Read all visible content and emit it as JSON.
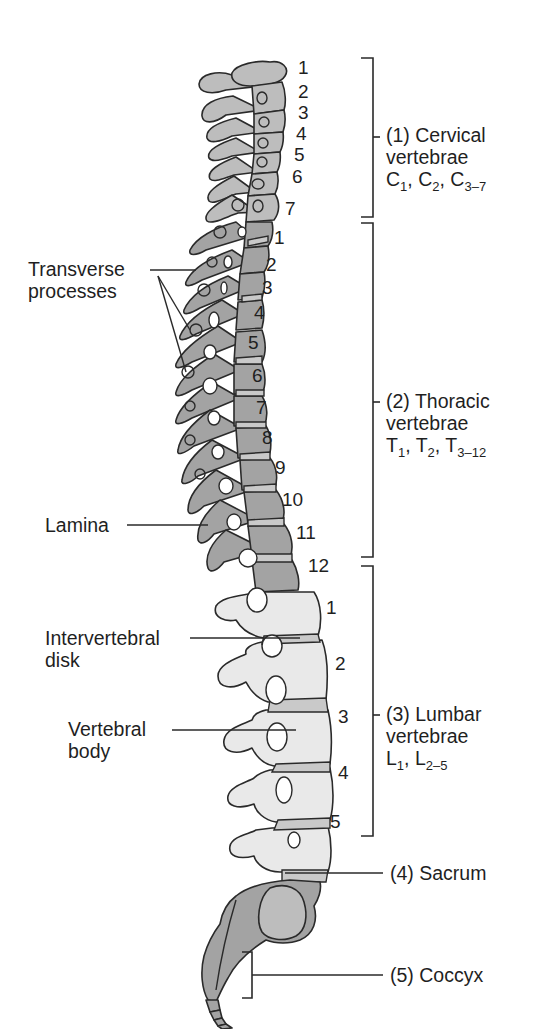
{
  "diagram": {
    "colors": {
      "bone_dark": "#a0a0a0",
      "bone_light": "#e8e8e8",
      "outline": "#2a2a2a",
      "disk": "#c8c8c8",
      "background": "#ffffff"
    },
    "regions": [
      {
        "id": "cervical",
        "index": "(1)",
        "name": "Cervical",
        "line2": "vertebrae",
        "formula": {
          "letter": "C",
          "parts": [
            "1",
            "2",
            "3–7"
          ]
        }
      },
      {
        "id": "thoracic",
        "index": "(2)",
        "name": "Thoracic",
        "line2": "vertebrae",
        "formula": {
          "letter": "T",
          "parts": [
            "1",
            "2",
            "3–12"
          ]
        }
      },
      {
        "id": "lumbar",
        "index": "(3)",
        "name": "Lumbar",
        "line2": "vertebrae",
        "formula": {
          "letter": "L",
          "parts": [
            "1",
            "2–5"
          ]
        }
      },
      {
        "id": "sacrum",
        "index": "(4)",
        "name": "Sacrum"
      },
      {
        "id": "coccyx",
        "index": "(5)",
        "name": "Coccyx"
      }
    ],
    "vertebra_numbers": {
      "cervical": [
        "1",
        "2",
        "3",
        "4",
        "5",
        "6",
        "7"
      ],
      "thoracic": [
        "1",
        "2",
        "3",
        "4",
        "5",
        "6",
        "7",
        "8",
        "9",
        "10",
        "11",
        "12"
      ],
      "lumbar": [
        "1",
        "2",
        "3",
        "4",
        "5"
      ]
    },
    "callouts": [
      {
        "id": "transverse",
        "line1": "Transverse",
        "line2": "processes"
      },
      {
        "id": "lamina",
        "line1": "Lamina"
      },
      {
        "id": "disk",
        "line1": "Intervertebral",
        "line2": "disk"
      },
      {
        "id": "body",
        "line1": "Vertebral",
        "line2": "body"
      }
    ]
  }
}
